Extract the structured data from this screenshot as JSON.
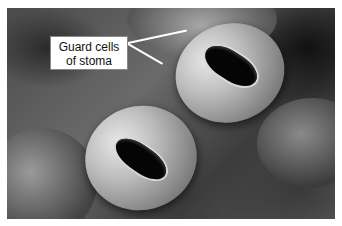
{
  "figure": {
    "label": {
      "line1": "Guard cells",
      "line2": "of stoma"
    },
    "colors": {
      "background": "#ffffff",
      "label_bg": "#ffffff",
      "leader_lines": "#ffffff",
      "pore": "#050505"
    }
  }
}
